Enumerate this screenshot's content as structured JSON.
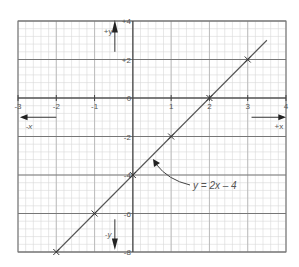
{
  "chart_data": {
    "type": "line",
    "title": "",
    "equation_label": "y = 2x – 4",
    "xlabel_pos": "+x",
    "xlabel_neg": "-x",
    "ylabel_pos": "+y",
    "ylabel_neg": "-y",
    "xlim": [
      -3,
      4
    ],
    "ylim": [
      -8,
      4
    ],
    "x_ticks": [
      -3,
      -2,
      -1,
      0,
      1,
      2,
      3,
      4
    ],
    "x_tick_labels": [
      "-3",
      "-2",
      "-1",
      "0",
      "1",
      "2",
      "3",
      "4"
    ],
    "y_ticks": [
      4,
      2,
      -2,
      -4,
      -6,
      -8
    ],
    "y_tick_labels": [
      "+4",
      "+2",
      "-2",
      "-4",
      "-6",
      "-8"
    ],
    "grid": true,
    "series": [
      {
        "name": "y = 2x - 4",
        "x": [
          -2,
          -1,
          0,
          1,
          2,
          3
        ],
        "y": [
          -8,
          -6,
          -4,
          -2,
          0,
          2
        ],
        "marker": "x",
        "line_extent": {
          "x_start": -2,
          "x_end": 3.5
        }
      }
    ],
    "colors": {
      "line": "#555555",
      "grid_major": "#777777",
      "grid_minor": "#d8d8d8",
      "text": "#555555"
    }
  }
}
